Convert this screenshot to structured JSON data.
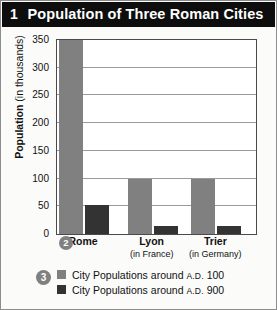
{
  "callouts": {
    "one": "1",
    "two": "2",
    "three": "3"
  },
  "colors": {
    "title_bar": "#0d0d0d",
    "series_ad100": "#808080",
    "series_ad900": "#333333",
    "plot_border": "#4a4a4a",
    "gridline": "#9a9a9a",
    "page_background": "#fbfbfa"
  },
  "axis_title": {
    "bold_part": "Population",
    "regular_part": " (in thousands)"
  },
  "legend": {
    "position": "below-plot",
    "items": [
      {
        "label_main": "City Populations around ",
        "label_ad": "A.D.",
        "label_year": " 100",
        "color": "#808080"
      },
      {
        "label_main": "City Populations around ",
        "label_ad": "A.D.",
        "label_year": " 900",
        "color": "#333333"
      }
    ]
  },
  "chart_data": {
    "type": "bar",
    "title": "Population of Three Roman Cities",
    "xlabel": "",
    "ylabel": "Population (in thousands)",
    "ylim": [
      0,
      350
    ],
    "yticks": [
      0,
      50,
      100,
      150,
      200,
      250,
      300,
      350
    ],
    "ytick_labels": [
      "0",
      "50",
      "100",
      "150",
      "200",
      "250",
      "300",
      "350"
    ],
    "grid": true,
    "categories": [
      "Rome",
      "Lyon",
      "Trier"
    ],
    "category_sublabels": [
      "",
      "(in France)",
      "(in Germany)"
    ],
    "series": [
      {
        "name": "City Populations around A.D. 100",
        "color": "#808080",
        "values": [
          350,
          100,
          100
        ]
      },
      {
        "name": "City Populations around A.D. 900",
        "color": "#333333",
        "values": [
          52,
          15,
          15
        ]
      }
    ]
  }
}
